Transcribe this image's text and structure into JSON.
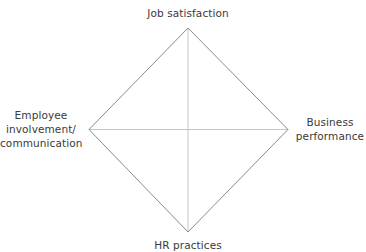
{
  "diagram": {
    "type": "diamond-framework",
    "vertices": {
      "top": "Job satisfaction",
      "left": [
        "Employee",
        "involvement/",
        "communication"
      ],
      "right": [
        "Business",
        "performance"
      ],
      "bottom": "HR practices"
    },
    "colors": {
      "outline": "#8a8a8a",
      "axes": "#c4c4c4",
      "text": "#3a3a3a",
      "background": "#ffffff"
    }
  }
}
